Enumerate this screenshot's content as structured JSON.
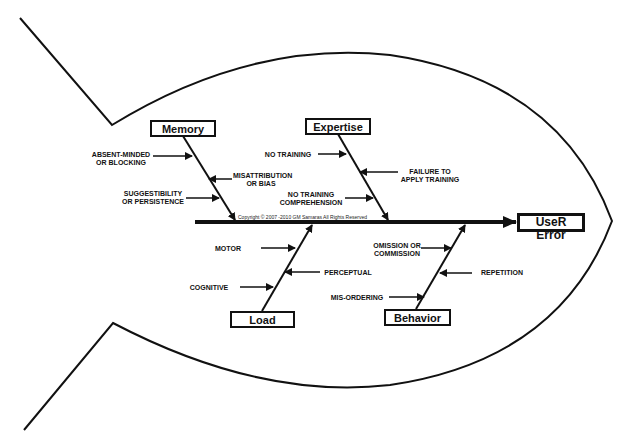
{
  "effect": {
    "label": "UseR Error"
  },
  "copyright": "Copyright © 2007 -2010  GM Samaras  All Rights Reserved",
  "categories": {
    "memory": {
      "label": "Memory",
      "causes": [
        "ABSENT-MINDED\nOR BLOCKING",
        "MISATTRIBUTION\nOR BIAS",
        "SUGGESTIBILITY\nOR PERSISTENCE"
      ]
    },
    "expertise": {
      "label": "Expertise",
      "causes": [
        "NO TRAINING",
        "FAILURE TO\nAPPLY TRAINING",
        "NO TRAINING\nCOMPREHENSION"
      ]
    },
    "load": {
      "label": "Load",
      "causes": [
        "MOTOR",
        "PERCEPTUAL",
        "COGNITIVE"
      ]
    },
    "behavior": {
      "label": "Behavior",
      "causes": [
        "OMISSION OR\nCOMMISSION",
        "REPETITION",
        "MIS-ORDERING"
      ]
    }
  },
  "colors": {
    "line": "#111111",
    "background": "#ffffff"
  }
}
